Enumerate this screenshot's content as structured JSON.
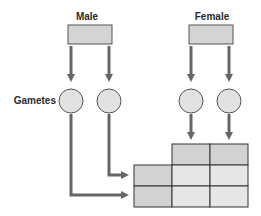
{
  "labels": {
    "male": "Male",
    "female": "Female",
    "gametes": "Gametes"
  },
  "colors": {
    "box_fill": "#d4d4d4",
    "circle_fill": "#e2e2e2",
    "grid_header_fill": "#d2d2d2",
    "grid_cell_fill": "#e6e6e6",
    "arrow": "#666666",
    "stroke": "#333333"
  },
  "grid": {
    "rows": 2,
    "cols": 2
  }
}
